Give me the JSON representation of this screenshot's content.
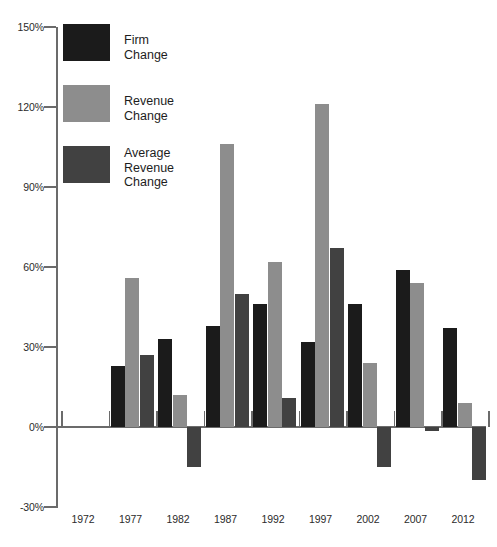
{
  "chart_data": {
    "type": "bar",
    "title": "",
    "subtitle": "",
    "xlabel": "",
    "ylabel": "",
    "categories": [
      "1972",
      "1977",
      "1982",
      "1987",
      "1992",
      "1997",
      "2002",
      "2007",
      "2012"
    ],
    "series": [
      {
        "name": "Firm Change",
        "color": "#1b1b1b",
        "values": [
          null,
          23,
          33,
          38,
          46,
          32,
          46,
          59,
          37
        ]
      },
      {
        "name": "Revenue Change",
        "color": "#8d8d8d",
        "values": [
          null,
          56,
          12,
          106,
          62,
          121,
          24,
          54,
          9
        ]
      },
      {
        "name": "Average Revenue Change",
        "color": "#414141",
        "values": [
          null,
          27,
          -15,
          50,
          11,
          67,
          -15,
          -1.5,
          -20
        ]
      }
    ],
    "ylim": [
      -30,
      150
    ],
    "yticks": [
      -30,
      0,
      30,
      60,
      90,
      120,
      150
    ],
    "ytick_labels": [
      "-30%",
      "0%",
      "30%",
      "60%",
      "90%",
      "120%",
      "150%"
    ],
    "grid": false,
    "legend_position": "top-left",
    "legend_entries": [
      {
        "label": "Firm Change",
        "color": "#1b1b1b"
      },
      {
        "label": "Revenue Change",
        "color": "#8d8d8d"
      },
      {
        "label": "Average\nRevenue\nChange",
        "color": "#414141"
      }
    ]
  }
}
